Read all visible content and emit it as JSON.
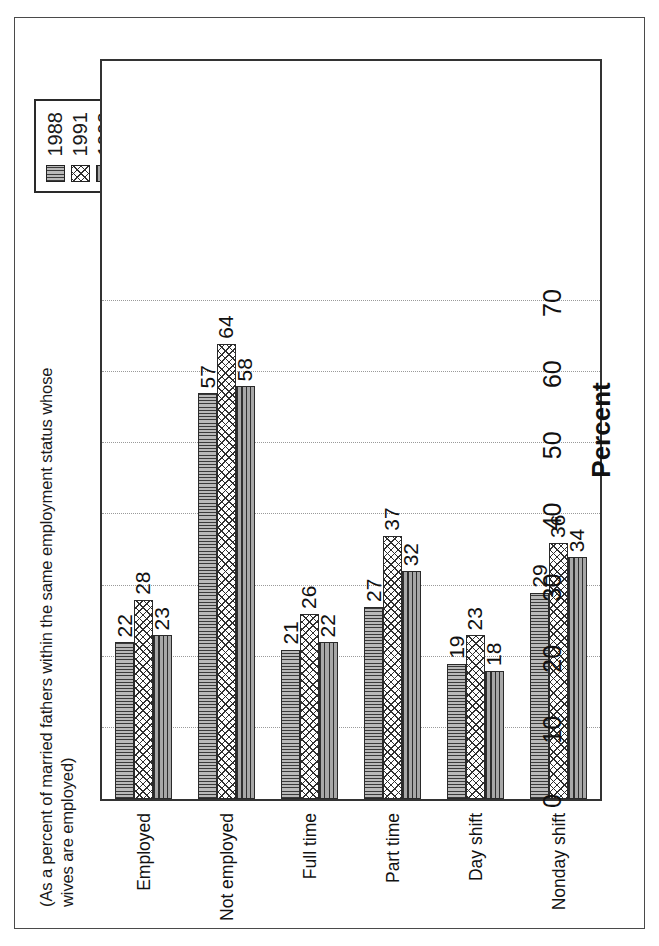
{
  "subtitle": "(As a percent of married fathers within the same employment status whose wives are employed)",
  "legend": {
    "items": [
      {
        "label": "1988",
        "pattern": "vertical-lines",
        "color": "#b9b9b9"
      },
      {
        "label": "1991",
        "pattern": "diamond-crosshatch",
        "color": "#ffffff"
      },
      {
        "label": "1993",
        "pattern": "horizontal-lines",
        "color": "#a7a7a7"
      }
    ]
  },
  "chart_data": {
    "type": "bar",
    "title": "",
    "subtitle": "(As a percent of married fathers within the same employment status whose wives are employed)",
    "orientation": "vertical",
    "categories": [
      "Employed",
      "Not employed",
      "Full time",
      "Part time",
      "Day shift",
      "Nonday shift"
    ],
    "series": [
      {
        "name": "1988",
        "values": [
          22,
          57,
          21,
          27,
          19,
          29
        ]
      },
      {
        "name": "1991",
        "values": [
          28,
          64,
          26,
          37,
          23,
          36
        ]
      },
      {
        "name": "1993",
        "values": [
          23,
          58,
          22,
          32,
          18,
          34
        ]
      }
    ],
    "xlabel": "",
    "ylabel": "Percent",
    "ylim": [
      0,
      70
    ],
    "yticks": [
      0,
      10,
      20,
      30,
      40,
      50,
      60,
      70
    ],
    "ytick_labels": [
      "0",
      "10",
      "20",
      "30",
      "40",
      "50",
      "60",
      "70"
    ],
    "grid": true,
    "grid_axis": "y",
    "grid_style": "dotted",
    "legend_position": "top-right",
    "data_labels": true
  }
}
